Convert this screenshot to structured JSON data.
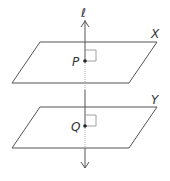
{
  "diagram": {
    "line_label": "ℓ",
    "planes": [
      {
        "label": "X",
        "point": "P"
      },
      {
        "label": "Y",
        "point": "Q"
      }
    ],
    "colors": {
      "stroke": "#555555",
      "point": "#222222",
      "hidden": "#aaaaaa"
    }
  }
}
